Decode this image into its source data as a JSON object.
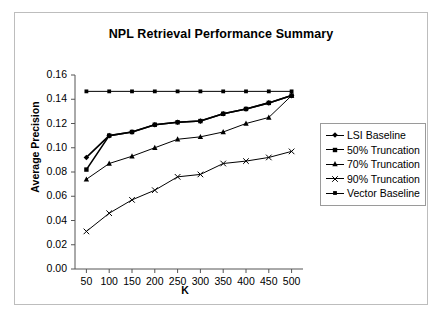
{
  "figure": {
    "title": "NPL Retrieval Performance Summary"
  },
  "chart_data": {
    "type": "line",
    "title": "NPL Retrieval Performance Summary",
    "xlabel": "K",
    "ylabel": "Average Precision",
    "x": [
      50,
      100,
      150,
      200,
      250,
      300,
      350,
      400,
      450,
      500
    ],
    "categories": [
      "50",
      "100",
      "150",
      "200",
      "250",
      "300",
      "350",
      "400",
      "450",
      "500"
    ],
    "xlim": [
      25,
      525
    ],
    "ylim": [
      0.0,
      0.16
    ],
    "yticks": [
      0.0,
      0.02,
      0.04,
      0.06,
      0.08,
      0.1,
      0.12,
      0.14,
      0.16
    ],
    "ytick_labels": [
      "0.00",
      "0.02",
      "0.04",
      "0.06",
      "0.08",
      "0.10",
      "0.12",
      "0.14",
      "0.16"
    ],
    "xticks": [
      50,
      100,
      150,
      200,
      250,
      300,
      350,
      400,
      450,
      500
    ],
    "grid": false,
    "legend_position": "right",
    "series": [
      {
        "name": "LSI Baseline",
        "marker": "diamond",
        "values": [
          0.092,
          0.11,
          0.113,
          0.119,
          0.121,
          0.122,
          0.128,
          0.132,
          0.137,
          0.143
        ]
      },
      {
        "name": "50% Truncation",
        "marker": "square",
        "values": [
          0.082,
          0.11,
          0.113,
          0.119,
          0.121,
          0.122,
          0.128,
          0.132,
          0.137,
          0.143
        ]
      },
      {
        "name": "70% Truncation",
        "marker": "triangle",
        "values": [
          0.074,
          0.087,
          0.093,
          0.1,
          0.107,
          0.109,
          0.113,
          0.12,
          0.125,
          0.143
        ]
      },
      {
        "name": "90% Truncation",
        "marker": "cross",
        "values": [
          0.031,
          0.046,
          0.057,
          0.065,
          0.076,
          0.078,
          0.087,
          0.089,
          0.092,
          0.097
        ]
      },
      {
        "name": "Vector Baseline",
        "marker": "asterisk",
        "values": [
          0.1465,
          0.1465,
          0.1465,
          0.1465,
          0.1465,
          0.1465,
          0.1465,
          0.1465,
          0.1465,
          0.1465
        ]
      }
    ]
  },
  "legend": {
    "items": [
      {
        "label": "LSI Baseline"
      },
      {
        "label": "50% Truncation"
      },
      {
        "label": "70% Truncation"
      },
      {
        "label": "90% Truncation"
      },
      {
        "label": "Vector Baseline"
      }
    ]
  },
  "colors": {
    "line": "#000000",
    "frame": "#bdbdbd",
    "axis": "#555555"
  }
}
